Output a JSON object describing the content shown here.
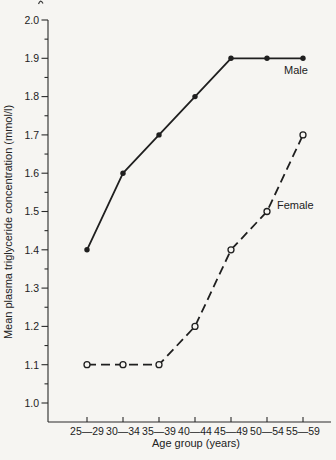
{
  "page": {
    "background": "#f6f5f2",
    "ink": "#1f1f1f"
  },
  "chart_data": {
    "type": "line",
    "title": "",
    "xlabel": "Age group (years)",
    "ylabel": "Mean plasma triglyceride concentration (mmol/l)",
    "categories": [
      "25—29",
      "30—34",
      "35—39",
      "40—44",
      "45—49",
      "50—54",
      "55—59"
    ],
    "ylim": [
      1.0,
      2.0
    ],
    "y_major_step": 0.1,
    "y_minor_step": 0.05,
    "y_tick_labels": [
      "1.0",
      "1.1",
      "1.2",
      "1.3",
      "1.4",
      "1.5",
      "1.6",
      "1.7",
      "1.8",
      "1.9",
      "2.0"
    ],
    "grid": false,
    "legend_position": "inline-labels",
    "series": [
      {
        "name": "Male",
        "values": [
          1.4,
          1.6,
          1.7,
          1.8,
          1.9,
          1.9,
          1.9
        ],
        "line_style": "solid",
        "marker": "filled-circle",
        "color": "#1f1f1f"
      },
      {
        "name": "Female",
        "values": [
          1.1,
          1.1,
          1.1,
          1.2,
          1.4,
          1.5,
          1.7
        ],
        "line_style": "dashed",
        "marker": "open-circle",
        "color": "#1f1f1f"
      }
    ]
  }
}
